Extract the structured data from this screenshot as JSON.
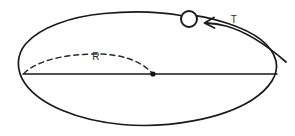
{
  "figure": {
    "type": "physics-orbit-diagram",
    "background_color": "#ffffff",
    "stroke_color": "#1a1a1a",
    "width": 295,
    "height": 136
  },
  "labels": {
    "radius": "R",
    "period": "T"
  },
  "elements": {
    "orbit_ellipse_name": "orbit-ellipse",
    "orbiting_body_name": "orbiting-body-circle",
    "center_point_name": "center-point-dot",
    "major_axis_name": "major-axis-line",
    "radius_arc_name": "radius-dashed-arc",
    "direction_arrow_name": "direction-arrow"
  },
  "geometry": {
    "ellipse_center_x": 150,
    "ellipse_center_y": 70,
    "ellipse_rx": 128,
    "ellipse_ry": 55,
    "body_circle_x": 189,
    "body_circle_y": 19,
    "body_circle_r": 8,
    "center_dot_x": 153,
    "center_dot_y": 74,
    "axis_start_x": 23,
    "axis_end_x": 277,
    "axis_y": 74,
    "radius_label_x": 96,
    "radius_label_y": 60,
    "period_label_x": 234,
    "period_label_y": 23
  }
}
